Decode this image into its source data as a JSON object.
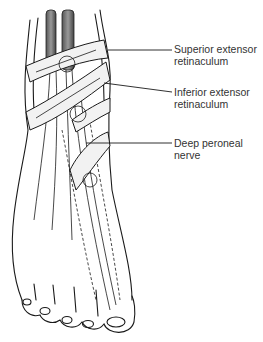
{
  "figure": {
    "labels": [
      {
        "id": "superior",
        "line1": "Superior extensor",
        "line2": "retinaculum"
      },
      {
        "id": "inferior",
        "line1": "Inferior extensor",
        "line2": "retinaculum"
      },
      {
        "id": "nerve",
        "line1": "Deep peroneal",
        "line2": "nerve"
      }
    ]
  },
  "colors": {
    "ink": "#1a1a1a",
    "label_text": "#333333",
    "background": "#ffffff"
  }
}
